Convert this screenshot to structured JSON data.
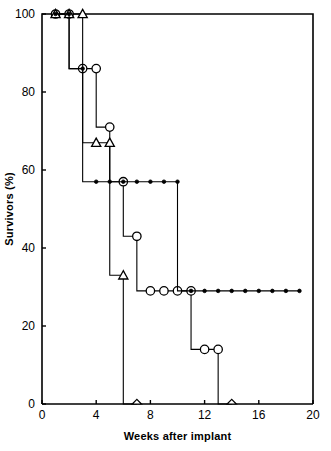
{
  "chart_data": {
    "type": "line",
    "title": "",
    "subtitle": "",
    "xlabel": "Weeks after implant",
    "ylabel": "Survivors (%)",
    "xlim": [
      0,
      20
    ],
    "ylim": [
      0,
      100
    ],
    "xticks": [
      0,
      4,
      8,
      12,
      16,
      20
    ],
    "yticks": [
      0,
      20,
      40,
      60,
      80,
      100
    ],
    "xtick_labels": [
      "0",
      "4",
      "8",
      "12",
      "16",
      "20"
    ],
    "ytick_labels": [
      "0",
      "20",
      "40",
      "60",
      "80",
      "100"
    ],
    "grid": false,
    "legend": false,
    "legend_position": "none",
    "plot_style": "kaplan-meier step survival curves",
    "frame": "box",
    "series": [
      {
        "name": "open-circle-series",
        "marker": "open-circle",
        "marker_size": 6,
        "color": "#000000",
        "x": [
          1,
          2,
          3,
          4,
          5,
          6,
          7,
          8,
          9,
          10,
          11,
          12,
          13,
          14
        ],
        "y": [
          100,
          100,
          86,
          86,
          71,
          57,
          43,
          29,
          29,
          29,
          29,
          14,
          14,
          0
        ],
        "points": [
          {
            "x": 1,
            "y": 100
          },
          {
            "x": 2,
            "y": 100
          },
          {
            "x": 3,
            "y": 86
          },
          {
            "x": 4,
            "y": 86
          },
          {
            "x": 5,
            "y": 71
          },
          {
            "x": 6,
            "y": 57
          },
          {
            "x": 7,
            "y": 43
          },
          {
            "x": 8,
            "y": 29
          },
          {
            "x": 9,
            "y": 29
          },
          {
            "x": 10,
            "y": 29
          },
          {
            "x": 11,
            "y": 29
          },
          {
            "x": 12,
            "y": 14
          },
          {
            "x": 13,
            "y": 14
          },
          {
            "x": 14,
            "y": 0
          }
        ]
      },
      {
        "name": "open-triangle-series",
        "marker": "open-triangle",
        "marker_size": 6,
        "color": "#000000",
        "x": [
          1,
          2,
          3,
          4,
          5,
          6,
          7
        ],
        "y": [
          100,
          100,
          100,
          67,
          67,
          33,
          0
        ],
        "points": [
          {
            "x": 1,
            "y": 100
          },
          {
            "x": 2,
            "y": 100
          },
          {
            "x": 3,
            "y": 100
          },
          {
            "x": 4,
            "y": 67
          },
          {
            "x": 5,
            "y": 67
          },
          {
            "x": 6,
            "y": 33
          },
          {
            "x": 7,
            "y": 0
          }
        ]
      },
      {
        "name": "filled-dot-series",
        "marker": "filled-dot",
        "marker_size": 3,
        "color": "#000000",
        "x": [
          1,
          2,
          3,
          4,
          5,
          6,
          7,
          8,
          9,
          10,
          11,
          12,
          13,
          14,
          15,
          16,
          17,
          18,
          19
        ],
        "y": [
          100,
          100,
          86,
          57,
          57,
          57,
          57,
          57,
          57,
          57,
          29,
          29,
          29,
          29,
          29,
          29,
          29,
          29,
          29
        ],
        "points": [
          {
            "x": 1,
            "y": 100
          },
          {
            "x": 2,
            "y": 100
          },
          {
            "x": 3,
            "y": 86
          },
          {
            "x": 4,
            "y": 57
          },
          {
            "x": 5,
            "y": 57
          },
          {
            "x": 6,
            "y": 57
          },
          {
            "x": 7,
            "y": 57
          },
          {
            "x": 8,
            "y": 57
          },
          {
            "x": 9,
            "y": 57
          },
          {
            "x": 10,
            "y": 57
          },
          {
            "x": 11,
            "y": 29
          },
          {
            "x": 12,
            "y": 29
          },
          {
            "x": 13,
            "y": 29
          },
          {
            "x": 14,
            "y": 29
          },
          {
            "x": 15,
            "y": 29
          },
          {
            "x": 16,
            "y": 29
          },
          {
            "x": 17,
            "y": 29
          },
          {
            "x": 18,
            "y": 29
          },
          {
            "x": 19,
            "y": 29
          }
        ]
      }
    ]
  }
}
